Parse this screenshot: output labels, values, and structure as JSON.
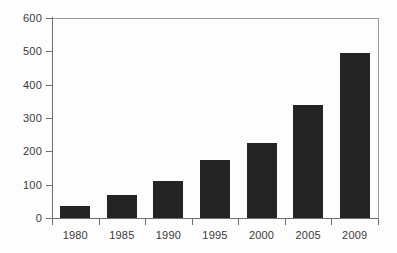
{
  "chart_data": {
    "type": "bar",
    "title": "",
    "subtitle": "",
    "xlabel": "",
    "ylabel": "",
    "categories": [
      "1980",
      "1985",
      "1990",
      "1995",
      "2000",
      "2005",
      "2009"
    ],
    "values": [
      35,
      70,
      110,
      175,
      225,
      340,
      495
    ],
    "ylim": [
      0,
      600
    ],
    "yticks": [
      "0",
      "100",
      "200",
      "300",
      "400",
      "500",
      "600"
    ],
    "ytick_values": [
      0,
      100,
      200,
      300,
      400,
      500,
      600
    ],
    "grid": false,
    "legend": null,
    "bar_color": "#242424",
    "axis_color": "#6e6e6e",
    "frame_color": "#9a9a9a",
    "text_color": "#3a3a3a",
    "background": "#fdfdfd"
  }
}
